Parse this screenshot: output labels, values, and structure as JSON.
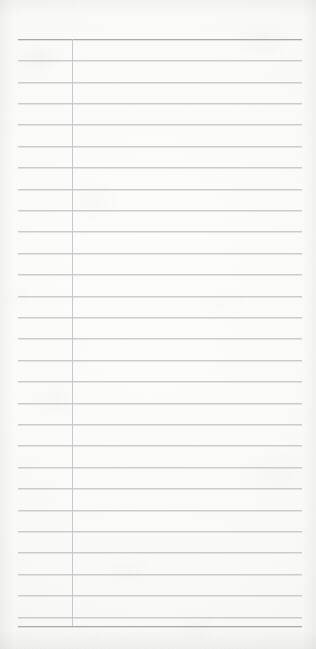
{
  "document": {
    "kind": "scanned-ruled-ledger-page",
    "title": "Blank ruled ledger page",
    "page_width": 316,
    "page_height": 649,
    "paper_color": "#fbfbfa",
    "paper_highlight": "#fdfdfc",
    "paper_shadow": "#eeeeed",
    "content_text": "",
    "handwriting": "",
    "printed_text": ""
  },
  "ruling": {
    "rule_color": "#c9c9cd",
    "border_rule_color": "#a9a9ae",
    "column_rule_color": "#c4c4c9",
    "horizontal_left_x": 18,
    "horizontal_right_x": 302,
    "first_rule_y": 39,
    "last_rule_y": 626,
    "rule_spacing": 21.4,
    "rule_count": 29,
    "horizontal_rules_y": [
      39,
      60,
      82,
      103,
      124,
      146,
      167,
      189,
      210,
      231,
      253,
      274,
      296,
      317,
      338,
      360,
      381,
      403,
      424,
      445,
      467,
      488,
      510,
      531,
      552,
      574,
      595,
      617,
      626
    ],
    "border_rule_indices": [
      0,
      28
    ],
    "vertical_rules": [
      {
        "name": "column-divider",
        "x": 72,
        "y_top": 39,
        "y_bottom": 626
      }
    ]
  },
  "margins": {
    "top_margin_height": 39,
    "bottom_margin_height": 23,
    "left_margin_width": 18,
    "right_margin_width": 14,
    "column_label": "",
    "column_width": 54
  }
}
